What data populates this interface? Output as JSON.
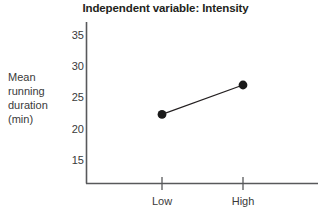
{
  "chart_data": {
    "type": "line",
    "title": "Independent variable: Intensity",
    "xlabel": "",
    "ylabel": "Mean running duration (min)",
    "ylabel_lines": [
      "Mean",
      "running",
      "duration",
      "(min)"
    ],
    "categories": [
      "Low",
      "High"
    ],
    "values": [
      22.3,
      27.0
    ],
    "series": [
      {
        "name": "Mean running duration",
        "values": [
          22.3,
          27.0
        ]
      }
    ],
    "yticks": [
      15,
      20,
      25,
      30,
      35
    ],
    "ytick_labels": [
      "15",
      "20",
      "25",
      "30",
      "35"
    ],
    "ylim": [
      12,
      37
    ],
    "grid": false,
    "legend": "none",
    "marker": "filled-circle",
    "colors": {
      "line": "#231f20",
      "marker": "#1a1a1a",
      "axis": "#58595b",
      "text": "#3a3a3a",
      "title": "#231f20",
      "background": "#ffffff"
    }
  },
  "axis": {
    "y_tick_0_label": "35",
    "y_tick_1_label": "30",
    "y_tick_2_label": "25",
    "y_tick_3_label": "20",
    "y_tick_4_label": "15",
    "x_tick_0_label": "Low",
    "x_tick_1_label": "High"
  },
  "ylabel": {
    "line_0": "Mean",
    "line_1": "running",
    "line_2": "duration",
    "line_3": "(min)"
  }
}
